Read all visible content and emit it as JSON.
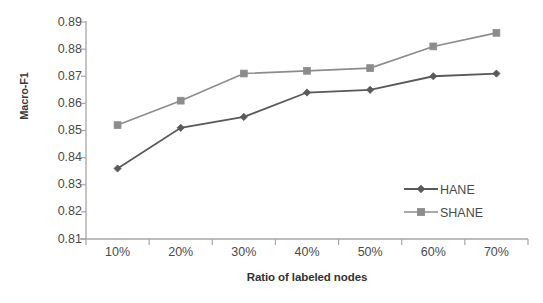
{
  "chart_data": {
    "type": "line",
    "title": "",
    "xlabel": "Ratio of labeled nodes",
    "ylabel": "Macro-F1",
    "categories": [
      "10%",
      "20%",
      "30%",
      "40%",
      "50%",
      "60%",
      "70%"
    ],
    "ylim": [
      0.81,
      0.89
    ],
    "ytick_labels": [
      "0.89",
      "0.88",
      "0.87",
      "0.86",
      "0.85",
      "0.84",
      "0.83",
      "0.82",
      "0.81"
    ],
    "ytick_values": [
      0.89,
      0.88,
      0.87,
      0.86,
      0.85,
      0.84,
      0.83,
      0.82,
      0.81
    ],
    "ytick_step": 0.01,
    "grid": false,
    "legend_position": "inside-right-lower",
    "series": [
      {
        "name": "HANE",
        "marker": "diamond",
        "color": "#595959",
        "values": [
          0.836,
          0.851,
          0.855,
          0.864,
          0.865,
          0.87,
          0.871
        ]
      },
      {
        "name": "SHANE",
        "marker": "square",
        "color": "#8c8c8c",
        "values": [
          0.852,
          0.861,
          0.871,
          0.872,
          0.873,
          0.881,
          0.886
        ]
      }
    ]
  },
  "legend": {
    "items": [
      {
        "label": "HANE"
      },
      {
        "label": "SHANE"
      }
    ]
  },
  "axes": {
    "axis_color": "#a6a6a6"
  }
}
